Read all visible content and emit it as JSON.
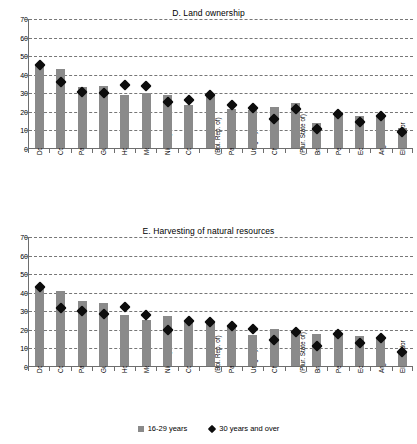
{
  "figure": {
    "legend": [
      {
        "label": "16-29 years",
        "marker": "bar-swatch",
        "color": "#8a8a8a"
      },
      {
        "label": "30 years and over",
        "marker": "diamond-swatch",
        "color": "#0d0d0d"
      }
    ]
  },
  "chart_data": [
    {
      "type": "bar",
      "title": "D. Land ownership",
      "xlabel": "",
      "ylabel": "",
      "ylim": [
        0,
        70
      ],
      "yticks": [
        0,
        10,
        20,
        30,
        40,
        50,
        60,
        70
      ],
      "grid": true,
      "legend_position": "bottom",
      "categories": [
        "Dominican Rep.",
        "Colombia",
        "Paraguay",
        "Guatemala",
        "Honduras",
        "Mexico",
        "Nicaragua",
        "Costa Rica",
        "Venezuela\n(Bol. Rep. of)",
        "Panama",
        "Uruguay",
        "Chile",
        "Bolivia\n(Plur. State of)",
        "Brazil",
        "Peru",
        "Ecuador",
        "Argentina",
        "El Salvador"
      ],
      "series": [
        {
          "name": "16-29 years",
          "type": "bar",
          "color": "#8a8a8a",
          "values": [
            44.8,
            42.6,
            33.0,
            33.2,
            28.4,
            29.6,
            28.8,
            23.0,
            29.2,
            21.2,
            20.6,
            22.0,
            24.4,
            13.6,
            18.6,
            17.0,
            17.4,
            10.8
          ]
        },
        {
          "name": "30 years and over",
          "type": "diamond-marker",
          "color": "#0d0d0d",
          "values": [
            44.8,
            35.8,
            30.0,
            29.6,
            34.0,
            33.6,
            24.8,
            26.0,
            28.8,
            23.4,
            21.6,
            15.4,
            20.8,
            10.0,
            18.4,
            14.2,
            17.4,
            8.8
          ]
        }
      ]
    },
    {
      "type": "bar",
      "title": "E. Harvesting of natural resources",
      "xlabel": "",
      "ylabel": "",
      "ylim": [
        0,
        70
      ],
      "yticks": [
        0,
        10,
        20,
        30,
        40,
        50,
        60,
        70
      ],
      "grid": true,
      "legend_position": "bottom",
      "categories": [
        "Dominican Rep.",
        "Colombia",
        "Paraguay",
        "Guatemala",
        "Honduras",
        "Mexico",
        "Nicaragua",
        "Costa Rica",
        "Venezuela\n(Bol. Rep. of)",
        "Panama",
        "Uruguay",
        "Chile",
        "Bolivia\n(Plur. State of)",
        "Brazil",
        "Peru",
        "Ecuador",
        "Argentina",
        "El Salvador"
      ],
      "series": [
        {
          "name": "16-29 years",
          "type": "bar",
          "color": "#8a8a8a",
          "values": [
            42.8,
            40.6,
            35.2,
            34.2,
            27.4,
            24.8,
            27.2,
            24.0,
            23.8,
            22.0,
            16.8,
            20.2,
            18.6,
            17.2,
            16.6,
            16.0,
            14.8,
            7.4
          ]
        },
        {
          "name": "30 years and over",
          "type": "diamond-marker",
          "color": "#0d0d0d",
          "values": [
            42.8,
            31.4,
            29.8,
            27.8,
            32.0,
            27.6,
            19.6,
            24.0,
            23.8,
            21.4,
            20.2,
            14.0,
            18.4,
            10.6,
            17.2,
            12.6,
            15.0,
            7.4
          ]
        }
      ]
    }
  ]
}
